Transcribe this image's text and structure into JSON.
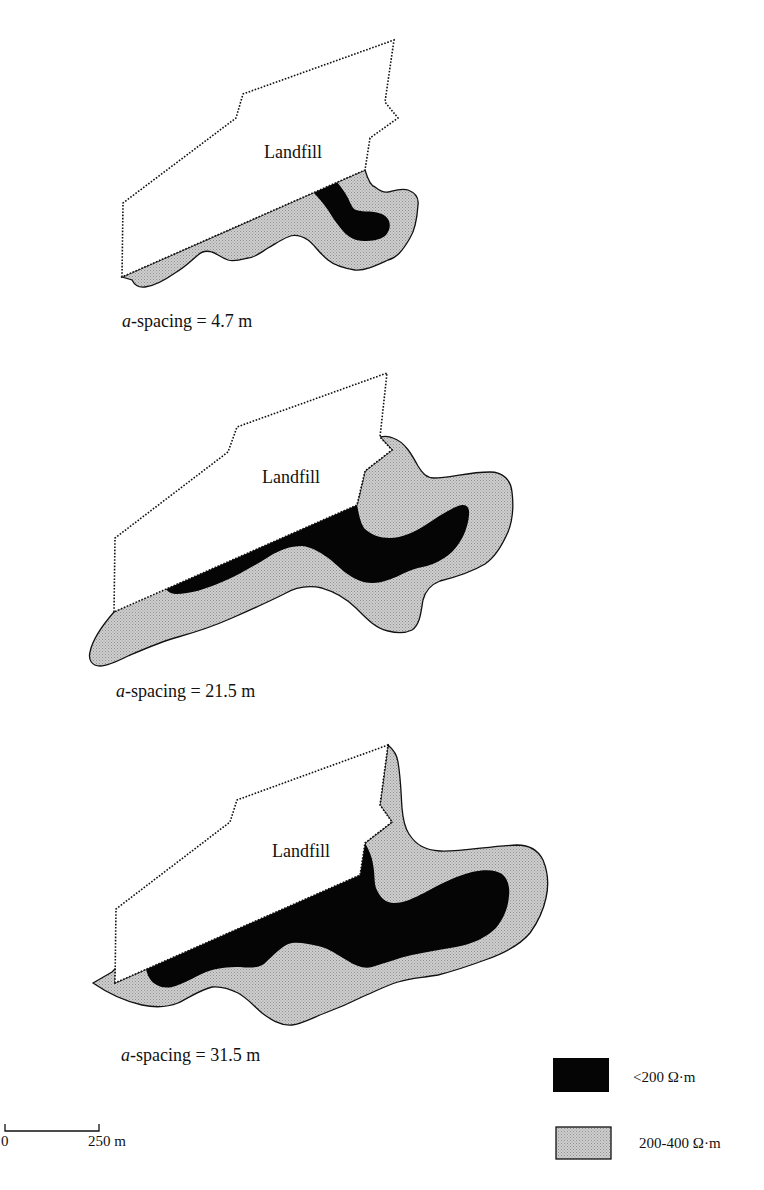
{
  "figure": {
    "panels": [
      {
        "landfill_label": "Landfill",
        "caption_italic": "a",
        "caption_rest": "-spacing = 4.7 m",
        "a_spacing_m": 4.7
      },
      {
        "landfill_label": "Landfill",
        "caption_italic": "a",
        "caption_rest": "-spacing = 21.5 m",
        "a_spacing_m": 21.5
      },
      {
        "landfill_label": "Landfill",
        "caption_italic": "a",
        "caption_rest": "-spacing = 31.5 m",
        "a_spacing_m": 31.5
      }
    ],
    "legend": {
      "items": [
        {
          "label": "<200 Ω·m",
          "color": "#050505",
          "pattern": "solid"
        },
        {
          "label": "200-400 Ω·m",
          "color": "#c8c8c8",
          "pattern": "stipple"
        }
      ]
    },
    "scale_bar": {
      "start_label": "0",
      "end_label": "250 m",
      "length_m": 250
    },
    "colors": {
      "low_resistivity": "#050505",
      "mid_resistivity": "#c8c8c8",
      "outline": "#111111",
      "background": "#ffffff"
    }
  }
}
